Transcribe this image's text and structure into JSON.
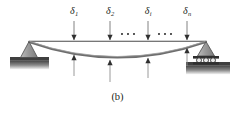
{
  "figure": {
    "caption": "(b)",
    "colors": {
      "line": "#3a3a3a",
      "beam_curve": "#6e6e6e",
      "support_fill": "#9a9a9a",
      "support_edge": "#4a4a4a",
      "ground_dark": "#3f3f3f",
      "ground_light": "#d8d8d8",
      "text": "#231f20",
      "background": "#ffffff"
    },
    "supports": [
      {
        "name": "pin-support",
        "type": "pin",
        "x": 29,
        "y": 46
      },
      {
        "name": "roller-support",
        "type": "roller",
        "x": 206,
        "y": 46,
        "rollers": 3
      }
    ],
    "reference_line": {
      "x1": 29,
      "y1": 41,
      "x2": 206,
      "y2": 41
    },
    "loads": [
      {
        "label": "δ",
        "sub": "1",
        "x": 74,
        "label_y": 6,
        "arrow_top": 21,
        "arrow_bottom": 40,
        "up_arrow_top": 55,
        "up_arrow_bottom": 76
      },
      {
        "label": "δ",
        "sub": "2",
        "x": 110,
        "label_y": 6,
        "arrow_top": 21,
        "arrow_bottom": 40,
        "up_arrow_top": 60,
        "up_arrow_bottom": 82
      },
      {
        "label": "δ",
        "sub": "i",
        "x": 148,
        "label_y": 6,
        "arrow_top": 21,
        "arrow_bottom": 40,
        "up_arrow_top": 58,
        "up_arrow_bottom": 78
      },
      {
        "label": "δ",
        "sub": "n",
        "x": 187,
        "label_y": 6,
        "arrow_top": 21,
        "arrow_bottom": 40,
        "up_arrow_top": 48,
        "up_arrow_bottom": 66
      }
    ],
    "ellipses": [
      {
        "name": "ellipsis-left",
        "y": 34,
        "points": [
          122,
          128,
          134
        ]
      },
      {
        "name": "ellipsis-right",
        "y": 34,
        "points": [
          159,
          165,
          171
        ]
      }
    ],
    "deflection_curve": {
      "start": [
        29,
        42
      ],
      "end": [
        206,
        42
      ],
      "control": [
        117,
        73
      ],
      "max_deflection_x": 117
    }
  }
}
